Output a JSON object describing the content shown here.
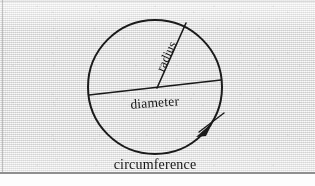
{
  "figure": {
    "kind": "geometry-diagram",
    "background_color": "#e6e6e6",
    "ink_color": "#1a1a1a",
    "circle": {
      "name": "circle-outline",
      "center_x": 155,
      "center_y": 87,
      "radius_x": 67,
      "radius_y": 67,
      "stroke_width": 2
    },
    "radius_segment": {
      "name": "radius-line",
      "x1": 157,
      "y1": 88,
      "x2": 186,
      "y2": 23,
      "stroke_width": 1.6
    },
    "diameter_segment": {
      "name": "diameter-line",
      "x1": 89,
      "y1": 95,
      "x2": 221,
      "y2": 80,
      "stroke_width": 1.6
    },
    "circumference_marker": {
      "name": "circumference-arrow",
      "arrow_tip_x": 200,
      "arrow_tip_y": 134,
      "tick_x1": 199,
      "tick_y1": 131,
      "tick_x2": 222,
      "tick_y2": 114
    },
    "labels": {
      "radius": "radius",
      "diameter": "diameter",
      "circumference": "circumference"
    },
    "label_positions": {
      "radius": {
        "x": 170,
        "y": 58,
        "rotation_deg": -66
      },
      "diameter": {
        "x": 155,
        "y": 105,
        "rotation_deg": -4
      },
      "circumference": {
        "x": 155,
        "y": 168,
        "rotation_deg": 0
      }
    }
  }
}
